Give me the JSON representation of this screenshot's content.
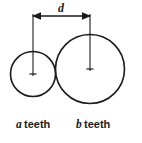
{
  "figure": {
    "name": "gear-pair-center-distance-diagram",
    "background_color": "#ffffff",
    "line_color": "#1a1a1a",
    "width": 142,
    "height": 143
  },
  "dimension": {
    "label": "d",
    "meaning": "center distance",
    "line_y": 16,
    "start_x": 32,
    "end_x": 90,
    "label_x": 61,
    "label_y": 11,
    "arrow_left_name": "arrow-left",
    "arrow_right_name": "arrow-right"
  },
  "gears": [
    {
      "id": "gear-a",
      "role": "small-pinion",
      "caption_variable": "a",
      "caption_word": "teeth",
      "center_x": 33,
      "center_y": 74,
      "radius": 22.5,
      "caption_var_x": 16,
      "caption_word_x": 24,
      "caption_y": 128
    },
    {
      "id": "gear-b",
      "role": "large-gear",
      "caption_variable": "b",
      "caption_word": "teeth",
      "center_x": 90,
      "center_y": 69,
      "radius": 34.5,
      "caption_var_x": 76,
      "caption_word_x": 84,
      "caption_y": 128
    }
  ],
  "extension_lines": [
    {
      "name": "extension-line-left",
      "x": 33,
      "y_top": 14,
      "y_bottom": 76
    },
    {
      "name": "extension-line-right",
      "x": 90,
      "y_top": 14,
      "y_bottom": 71
    }
  ],
  "center_marks": [
    {
      "name": "center-mark-gear-a",
      "x": 33,
      "y": 74,
      "size": 3.5
    },
    {
      "name": "center-mark-gear-b",
      "x": 90,
      "y": 69,
      "size": 3.5
    }
  ]
}
